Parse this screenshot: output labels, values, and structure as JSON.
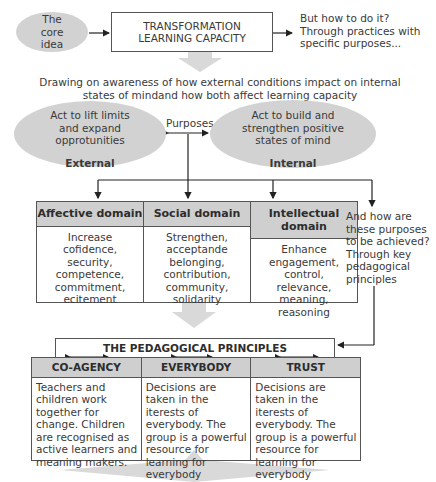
{
  "core": {
    "oval_label": "The core idea",
    "title_box": "TRANSFORMATION LEARNING CAPACITY",
    "question": "But how to do it? Through practices with specific purposes..."
  },
  "awareness": {
    "text_line1": "Drawing on awareness of how external conditions impact on internal",
    "text_line2": "states of mindand how both affect learning capacity"
  },
  "purposes": {
    "label": "Purposes",
    "external": {
      "text": "Act to lift limits and expand opprotunities",
      "label": "External"
    },
    "internal": {
      "text": "Act to build and strengthen positive states of mind",
      "label": "Internal"
    }
  },
  "domains": [
    {
      "title": "Affective domain",
      "body": [
        "Increase",
        "cofidence,",
        "security,",
        "competence,",
        "commitment,",
        "ecitement"
      ]
    },
    {
      "title": "Social domain",
      "body": [
        "Strengthen,",
        "acceptande",
        "belonging,",
        "contribution,",
        "community,",
        "solidarity"
      ]
    },
    {
      "title": "Intellectual domain",
      "body": [
        "Enhance",
        "engagement,",
        "control,",
        "relevance,",
        "meaning,",
        "reasoning"
      ]
    }
  ],
  "how_note": "And how are these purposes to be achieved? Through key pedagogical principles",
  "principles": {
    "title": "THE PEDAGOGICAL PRINCIPLES",
    "items": [
      {
        "title": "CO-AGENCY",
        "body": "Teachers and children work together for change. Children are recognised as active learners and meaning makers."
      },
      {
        "title": "EVERYBODY",
        "body": "Decisions are taken in the iterests of everybody. The group is a powerful resource for learning for everybody"
      },
      {
        "title": "TRUST",
        "body": "Decisions are taken in the iterests of everybody. The group is a powerful resource for learning for everybody"
      }
    ]
  },
  "colors": {
    "oval_fill": "#d2d2d2",
    "header_fill": "#cfcfcf",
    "big_arrow": "#d9d9d9",
    "line": "#222222"
  }
}
